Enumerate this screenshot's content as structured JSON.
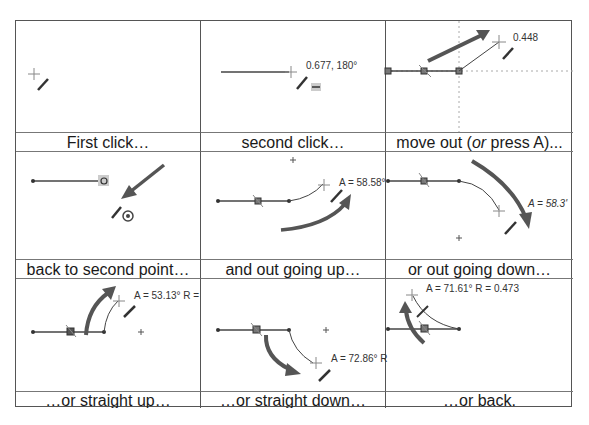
{
  "figure": {
    "cells": [
      {
        "caption": "First click…",
        "annotation": ""
      },
      {
        "caption": "second click…",
        "annotation": "0.677, 180°"
      },
      {
        "caption_pre": "move out (",
        "caption_em": "or",
        "caption_post": " press A)...",
        "annotation": "0.448"
      },
      {
        "caption": "back to second point…",
        "annotation": ""
      },
      {
        "caption": "and out going up…",
        "annotation": "A = 58.58°"
      },
      {
        "caption": "or out going down…",
        "annotation": "A = 58.3'"
      },
      {
        "caption": "…or straight up…",
        "annotation": "A = 53.13° R ="
      },
      {
        "caption": "…or straight down…",
        "annotation": "A = 72.86° R"
      },
      {
        "caption": "…or back.",
        "annotation": "A = 71.61° R = 0.473"
      }
    ],
    "colors": {
      "line": "#444444",
      "arrow": "#555555",
      "border": "#555555",
      "cursor": "#777777"
    }
  }
}
